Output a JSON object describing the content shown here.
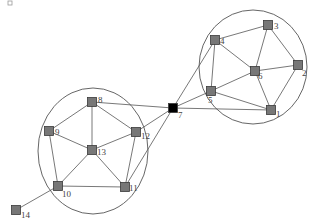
{
  "diagram": {
    "type": "network-graph",
    "corner_mark": {
      "x": 10,
      "y": 3
    },
    "colors": {
      "node_default": "#777777",
      "node_highlight": "#000000",
      "edge": "#555555",
      "cluster": "#555555"
    },
    "clusters": [
      {
        "id": "right",
        "cx": 253,
        "cy": 67,
        "rx": 54,
        "ry": 57
      },
      {
        "id": "left",
        "cx": 93,
        "cy": 151,
        "rx": 55,
        "ry": 63
      }
    ],
    "nodes": [
      {
        "id": "1",
        "label": "1",
        "x": 271,
        "y": 110,
        "lx": 276,
        "ly": 117,
        "color": "#777777"
      },
      {
        "id": "2",
        "label": "2",
        "x": 298,
        "y": 65,
        "lx": 302,
        "ly": 76,
        "color": "#777777"
      },
      {
        "id": "3",
        "label": "3",
        "x": 268,
        "y": 25,
        "lx": 274,
        "ly": 29,
        "color": "#777777"
      },
      {
        "id": "4",
        "label": "4",
        "x": 215,
        "y": 40,
        "lx": 220,
        "ly": 44,
        "color": "#777777"
      },
      {
        "id": "5",
        "label": "5",
        "x": 211,
        "y": 91,
        "lx": 208,
        "ly": 103,
        "color": "#777777"
      },
      {
        "id": "6",
        "label": "6",
        "x": 255,
        "y": 71,
        "lx": 258,
        "ly": 79,
        "color": "#777777"
      },
      {
        "id": "7",
        "label": "7",
        "x": 173,
        "y": 108,
        "lx": 178,
        "ly": 118,
        "color": "#000000"
      },
      {
        "id": "8",
        "label": "8",
        "x": 92,
        "y": 102,
        "lx": 98,
        "ly": 103,
        "color": "#777777"
      },
      {
        "id": "9",
        "label": "9",
        "x": 49,
        "y": 131,
        "lx": 55,
        "ly": 135,
        "color": "#777777"
      },
      {
        "id": "10",
        "label": "10",
        "x": 58,
        "y": 186,
        "lx": 62,
        "ly": 197,
        "color": "#777777"
      },
      {
        "id": "11",
        "label": "11",
        "x": 125,
        "y": 187,
        "lx": 129,
        "ly": 191,
        "color": "#777777"
      },
      {
        "id": "12",
        "label": "12",
        "x": 136,
        "y": 132,
        "lx": 141,
        "ly": 139,
        "color": "#777777"
      },
      {
        "id": "13",
        "label": "13",
        "x": 92,
        "y": 150,
        "lx": 97,
        "ly": 155,
        "color": "#777777"
      },
      {
        "id": "14",
        "label": "14",
        "x": 16,
        "y": 210,
        "lx": 21,
        "ly": 218,
        "color": "#777777"
      }
    ],
    "edges": [
      [
        "4",
        "3"
      ],
      [
        "4",
        "6"
      ],
      [
        "4",
        "5"
      ],
      [
        "3",
        "6"
      ],
      [
        "3",
        "2"
      ],
      [
        "6",
        "2"
      ],
      [
        "6",
        "5"
      ],
      [
        "6",
        "1"
      ],
      [
        "2",
        "1"
      ],
      [
        "5",
        "1"
      ],
      [
        "7",
        "4"
      ],
      [
        "7",
        "5"
      ],
      [
        "7",
        "1"
      ],
      [
        "8",
        "9"
      ],
      [
        "8",
        "13"
      ],
      [
        "8",
        "12"
      ],
      [
        "9",
        "13"
      ],
      [
        "9",
        "10"
      ],
      [
        "12",
        "13"
      ],
      [
        "12",
        "11"
      ],
      [
        "13",
        "10"
      ],
      [
        "13",
        "11"
      ],
      [
        "10",
        "11"
      ],
      [
        "10",
        "14"
      ],
      [
        "7",
        "8"
      ],
      [
        "7",
        "12"
      ],
      [
        "7",
        "11"
      ]
    ]
  }
}
